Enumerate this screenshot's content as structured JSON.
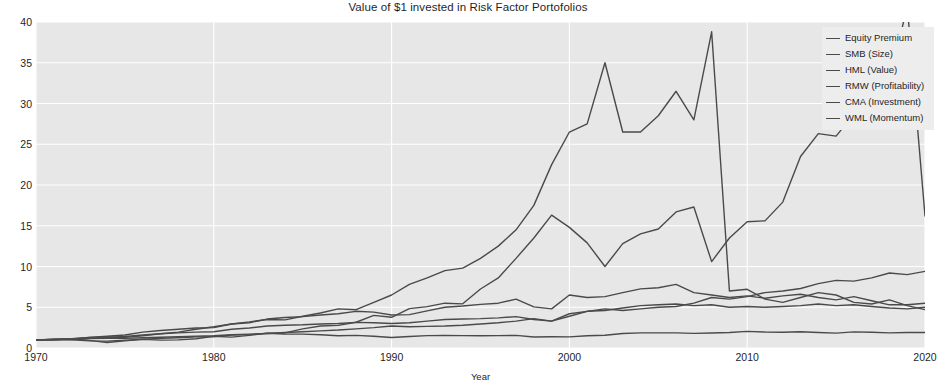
{
  "chart_data": {
    "type": "line",
    "title": "Value of $1 invested in Risk Factor Portofolios",
    "xlabel": "Year",
    "ylabel": "",
    "xlim": [
      1970,
      2020
    ],
    "ylim": [
      0,
      40
    ],
    "xticks": [
      1970,
      1980,
      1990,
      2000,
      2010,
      2020
    ],
    "yticks": [
      0,
      5,
      10,
      15,
      20,
      25,
      30,
      35,
      40
    ],
    "xtick_labels": [
      "1970",
      "1980",
      "1990",
      "2000",
      "2010",
      "2020"
    ],
    "ytick_labels": [
      "0",
      "5",
      "10",
      "15",
      "20",
      "25",
      "30",
      "35",
      "40"
    ],
    "grid": true,
    "grid_color": "#ffffff",
    "plot_background": "#e7e7e7",
    "line_color": "#4a4a4a",
    "legend_position": "upper right",
    "x": [
      1970,
      1971,
      1972,
      1973,
      1974,
      1975,
      1976,
      1977,
      1978,
      1979,
      1980,
      1981,
      1982,
      1983,
      1984,
      1985,
      1986,
      1987,
      1988,
      1989,
      1990,
      1991,
      1992,
      1993,
      1994,
      1995,
      1996,
      1997,
      1998,
      1999,
      2000,
      2001,
      2002,
      2003,
      2004,
      2005,
      2006,
      2007,
      2008,
      2009,
      2010,
      2011,
      2012,
      2013,
      2014,
      2015,
      2016,
      2017,
      2018,
      2019,
      2020
    ],
    "series": [
      {
        "name": "Equity Premium",
        "color": "#4a4a4a",
        "values": [
          1.0,
          1.02,
          1.12,
          0.93,
          0.67,
          0.88,
          1.06,
          0.97,
          1.0,
          1.14,
          1.44,
          1.33,
          1.55,
          1.83,
          1.85,
          2.35,
          2.7,
          2.77,
          3.16,
          4.0,
          3.77,
          4.83,
          5.08,
          5.5,
          5.42,
          7.24,
          8.6,
          11.0,
          13.5,
          16.3,
          14.8,
          12.9,
          10.0,
          12.8,
          14.0,
          14.6,
          16.7,
          17.3,
          10.6,
          13.5,
          15.5,
          15.6,
          17.9,
          23.5,
          26.3,
          26.0,
          28.7,
          34.4,
          32.4,
          42.0,
          16.2
        ],
        "end_value": 16.2
      },
      {
        "name": "SMB (Size)",
        "color": "#4a4a4a",
        "values": [
          1.0,
          1.06,
          1.02,
          0.88,
          0.84,
          0.96,
          1.08,
          1.18,
          1.25,
          1.36,
          1.4,
          1.58,
          1.64,
          1.8,
          1.72,
          1.7,
          1.62,
          1.5,
          1.55,
          1.45,
          1.28,
          1.42,
          1.52,
          1.55,
          1.52,
          1.5,
          1.52,
          1.55,
          1.35,
          1.38,
          1.36,
          1.5,
          1.56,
          1.78,
          1.86,
          1.85,
          1.86,
          1.8,
          1.84,
          1.9,
          2.04,
          1.96,
          1.94,
          2.0,
          1.9,
          1.83,
          1.98,
          1.93,
          1.86,
          1.9,
          1.9
        ],
        "end_value": 1.9
      },
      {
        "name": "HML (Value)",
        "color": "#4a4a4a",
        "values": [
          1.0,
          1.04,
          1.1,
          1.3,
          1.45,
          1.6,
          1.95,
          2.15,
          2.3,
          2.45,
          2.5,
          2.95,
          3.1,
          3.55,
          3.75,
          3.85,
          4.05,
          4.2,
          4.5,
          4.4,
          4.05,
          4.1,
          4.55,
          5.0,
          5.15,
          5.35,
          5.5,
          6.0,
          5.05,
          4.8,
          6.5,
          6.2,
          6.3,
          6.8,
          7.25,
          7.4,
          7.8,
          6.8,
          6.5,
          6.2,
          6.4,
          6.1,
          6.4,
          6.6,
          6.2,
          5.9,
          6.3,
          5.8,
          5.3,
          5.3,
          5.5
        ],
        "end_value": 5.5
      },
      {
        "name": "RMW (Profitability)",
        "color": "#4a4a4a",
        "values": [
          1.0,
          1.02,
          1.05,
          1.15,
          1.2,
          1.18,
          1.25,
          1.32,
          1.38,
          1.45,
          1.5,
          1.62,
          1.7,
          1.78,
          1.9,
          2.0,
          2.1,
          2.2,
          2.35,
          2.5,
          2.7,
          2.6,
          2.65,
          2.7,
          2.8,
          2.95,
          3.1,
          3.3,
          3.6,
          3.3,
          3.9,
          4.5,
          4.8,
          4.6,
          4.8,
          5.0,
          5.1,
          5.5,
          6.2,
          6.0,
          6.3,
          6.8,
          7.0,
          7.3,
          7.9,
          8.3,
          8.2,
          8.6,
          9.2,
          9.0,
          9.4
        ],
        "end_value": 9.4
      },
      {
        "name": "CMA (Investment)",
        "color": "#4a4a4a",
        "values": [
          1.0,
          1.05,
          1.08,
          1.2,
          1.3,
          1.42,
          1.6,
          1.75,
          1.85,
          1.95,
          2.0,
          2.3,
          2.45,
          2.7,
          2.8,
          2.85,
          2.95,
          3.0,
          3.15,
          3.1,
          3.0,
          3.1,
          3.3,
          3.5,
          3.55,
          3.6,
          3.7,
          3.85,
          3.5,
          3.3,
          4.2,
          4.5,
          4.6,
          4.9,
          5.2,
          5.3,
          5.4,
          5.2,
          5.3,
          5.0,
          5.1,
          5.0,
          5.1,
          5.2,
          5.4,
          5.2,
          5.3,
          5.1,
          4.9,
          4.8,
          5.0
        ],
        "end_value": 5.0
      },
      {
        "name": "WML (Momentum)",
        "color": "#4a4a4a",
        "values": [
          1.0,
          1.08,
          1.15,
          1.28,
          1.35,
          1.3,
          1.5,
          1.75,
          1.95,
          2.3,
          2.6,
          2.95,
          3.2,
          3.5,
          3.45,
          3.9,
          4.3,
          4.8,
          4.7,
          5.6,
          6.5,
          7.8,
          8.6,
          9.5,
          9.8,
          11.0,
          12.5,
          14.5,
          17.5,
          22.5,
          26.5,
          27.5,
          35.0,
          26.5,
          26.5,
          28.5,
          31.5,
          28.0,
          38.8,
          7.0,
          7.2,
          6.0,
          5.6,
          6.2,
          6.8,
          6.5,
          5.6,
          5.4,
          5.9,
          5.2,
          4.7
        ],
        "end_value": 4.7
      }
    ]
  },
  "legend": {
    "items": [
      {
        "label": "Equity Premium"
      },
      {
        "label": "SMB (Size)"
      },
      {
        "label": "HML (Value)"
      },
      {
        "label": "RMW (Profitability)"
      },
      {
        "label": "CMA (Investment)"
      },
      {
        "label": "WML (Momentum)"
      }
    ]
  }
}
